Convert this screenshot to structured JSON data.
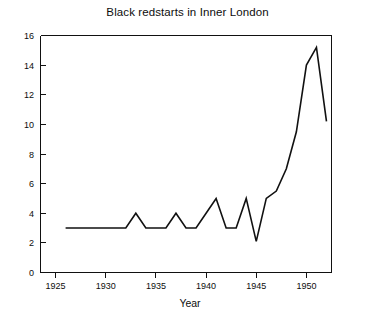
{
  "chart_data": {
    "type": "line",
    "title": "Black redstarts in Inner London",
    "xlabel": "Year",
    "ylabel": "",
    "xlim": [
      1923.5,
      1952.5
    ],
    "ylim": [
      0,
      16
    ],
    "xticks": [
      1925,
      1930,
      1935,
      1940,
      1945,
      1950
    ],
    "xtick_labels": [
      "1925",
      "1930",
      "1935",
      "1940",
      "1945",
      "1950"
    ],
    "yticks": [
      0,
      2,
      4,
      6,
      8,
      10,
      12,
      14,
      16
    ],
    "ytick_labels": [
      "0",
      "2",
      "4",
      "6",
      "8",
      "10",
      "12",
      "14",
      "16"
    ],
    "grid": false,
    "legend": null,
    "series": [
      {
        "name": "Black redstarts",
        "x": [
          1926,
          1927,
          1928,
          1929,
          1930,
          1931,
          1932,
          1933,
          1934,
          1935,
          1936,
          1937,
          1938,
          1939,
          1940,
          1941,
          1942,
          1943,
          1944,
          1945,
          1946,
          1947,
          1948,
          1949,
          1950,
          1951,
          1952
        ],
        "values": [
          3,
          3,
          3,
          3,
          3,
          3,
          3,
          4,
          3,
          3,
          3,
          4,
          3,
          3,
          4,
          5,
          3,
          3,
          5,
          2.1,
          5,
          5.5,
          7,
          9.5,
          14,
          15.2,
          10.2
        ]
      }
    ]
  },
  "figure": {
    "background_color": "#ffffff",
    "line_color": "#111111",
    "axis_color": "#111111"
  }
}
